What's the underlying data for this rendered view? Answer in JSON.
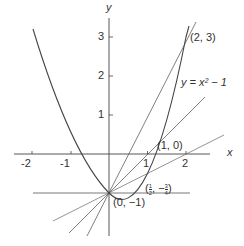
{
  "figure": {
    "axes": {
      "x_label": "x",
      "y_label": "y",
      "x_ticks": [
        "-2",
        "-1",
        "1",
        "2"
      ],
      "y_ticks": [
        "1",
        "2",
        "3"
      ]
    },
    "curve_label": "y = x² − 1",
    "points": [
      {
        "id": "p0",
        "label": "(0, −1)",
        "x": 0,
        "y": -1
      },
      {
        "id": "p1",
        "label": "(1, 0)",
        "x": 1,
        "y": 0
      },
      {
        "id": "p2",
        "label": "(2, 3)",
        "x": 2,
        "y": 3
      },
      {
        "id": "phalf",
        "label_prefix": "(",
        "num": "1",
        "den": "2",
        "sep": ", −",
        "num2": "3",
        "den2": "4",
        "label_suffix": ")",
        "x": 0.5,
        "y": -0.75
      }
    ],
    "lines": [
      {
        "name": "secant-to-2-3",
        "slope": 2
      },
      {
        "name": "secant-to-1-0",
        "slope": 1
      },
      {
        "name": "secant-to-half",
        "slope": 0.5
      },
      {
        "name": "tangent-horizontal",
        "slope": 0
      },
      {
        "name": "steep-line",
        "slope": 3
      }
    ],
    "colors": {
      "ink": "#333333",
      "background": "#ffffff"
    }
  }
}
